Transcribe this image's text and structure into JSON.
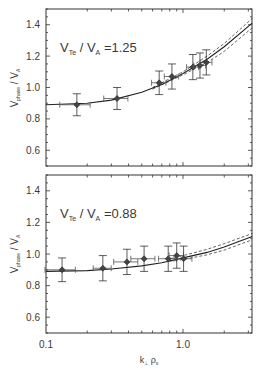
{
  "chart_data": [
    {
      "type": "scatter",
      "panel": "top",
      "annotation": {
        "main": "V",
        "sub1": "Te",
        "mid": " / V",
        "sub2": "A",
        "value": " =1.25"
      },
      "xlabel": "k⊥ ρs",
      "ylabel": "Vphase / VA",
      "xscale": "log",
      "xlim": [
        0.1,
        3.2
      ],
      "ylim": [
        0.5,
        1.5
      ],
      "yticks": [
        0.6,
        0.8,
        1.0,
        1.2,
        1.4
      ],
      "ytick_labels": [
        "0.6",
        "0.8",
        "1.0",
        "1.2",
        "1.4"
      ],
      "series": [
        {
          "name": "measured",
          "marker": "diamond",
          "x": [
            0.168,
            0.33,
            0.67,
            0.83,
            1.18,
            1.33,
            1.48
          ],
          "y": [
            0.89,
            0.93,
            1.03,
            1.07,
            1.13,
            1.14,
            1.16
          ],
          "yerr": [
            0.07,
            0.07,
            0.075,
            0.08,
            0.08,
            0.08,
            0.08
          ],
          "xerr_frac": [
            0.25,
            0.2,
            0.12,
            0.12,
            0.1,
            0.1,
            0.1
          ]
        },
        {
          "name": "theory",
          "style": "solid",
          "x": [
            0.1,
            0.2,
            0.3,
            0.5,
            0.7,
            1.0,
            1.5,
            2.0,
            3.2
          ],
          "y": [
            0.89,
            0.9,
            0.92,
            0.97,
            1.02,
            1.09,
            1.18,
            1.26,
            1.41
          ]
        },
        {
          "name": "theory-upper",
          "style": "dashed",
          "x": [
            0.6,
            1.0,
            1.5,
            2.0,
            3.2
          ],
          "y": [
            1.0,
            1.1,
            1.2,
            1.28,
            1.44
          ]
        },
        {
          "name": "theory-lower",
          "style": "dashed",
          "x": [
            0.6,
            1.0,
            1.5,
            2.0,
            3.2
          ],
          "y": [
            0.99,
            1.08,
            1.16,
            1.23,
            1.38
          ]
        }
      ]
    },
    {
      "type": "scatter",
      "panel": "bottom",
      "annotation": {
        "main": "V",
        "sub1": "Te",
        "mid": " / V",
        "sub2": "A",
        "value": " =0.88"
      },
      "xlabel": "k⊥ ρs",
      "ylabel": "Vphase / VA",
      "xscale": "log",
      "xlim": [
        0.1,
        3.2
      ],
      "ylim": [
        0.5,
        1.5
      ],
      "xticks": [
        0.1,
        1.0
      ],
      "xtick_labels": [
        "0.1",
        "1.0"
      ],
      "yticks": [
        0.6,
        0.8,
        1.0,
        1.2,
        1.4
      ],
      "ytick_labels": [
        "0.6",
        "0.8",
        "1.0",
        "1.2",
        "1.4"
      ],
      "series": [
        {
          "name": "measured",
          "marker": "diamond",
          "x": [
            0.131,
            0.26,
            0.39,
            0.52,
            0.78,
            0.9,
            1.01
          ],
          "y": [
            0.9,
            0.91,
            0.95,
            0.97,
            0.97,
            0.99,
            0.97
          ],
          "yerr": [
            0.075,
            0.08,
            0.08,
            0.08,
            0.08,
            0.08,
            0.08
          ],
          "xerr_frac": [
            0.25,
            0.15,
            0.2,
            0.2,
            0.15,
            0.12,
            0.15
          ]
        },
        {
          "name": "theory",
          "style": "solid",
          "x": [
            0.1,
            0.2,
            0.3,
            0.5,
            0.7,
            1.0,
            1.5,
            2.0,
            3.2
          ],
          "y": [
            0.89,
            0.895,
            0.905,
            0.925,
            0.945,
            0.975,
            1.01,
            1.045,
            1.11
          ]
        },
        {
          "name": "theory-upper",
          "style": "dashed",
          "x": [
            0.8,
            1.0,
            1.5,
            2.0,
            3.2
          ],
          "y": [
            0.97,
            0.99,
            1.03,
            1.065,
            1.13
          ]
        },
        {
          "name": "theory-lower",
          "style": "dashed",
          "x": [
            0.8,
            1.0,
            1.5,
            2.0,
            3.2
          ],
          "y": [
            0.955,
            0.965,
            0.995,
            1.025,
            1.09
          ]
        }
      ]
    }
  ],
  "labels": {
    "top_annotation_main": "V",
    "top_annotation_sub1": "Te",
    "top_annotation_mid": " / V",
    "top_annotation_sub2": "A",
    "top_annotation_value": " =1.25",
    "bottom_annotation_main": "V",
    "bottom_annotation_sub1": "Te",
    "bottom_annotation_mid": " / V",
    "bottom_annotation_sub2": "A",
    "bottom_annotation_value": " =0.88",
    "ylabel_main": "V",
    "ylabel_sub": "phase",
    "ylabel_mid": " / V",
    "ylabel_sub2": "A",
    "xlabel_main": "k",
    "xlabel_sub": "⊥",
    "xlabel_mid": " ρ",
    "xlabel_sub2": "s",
    "xtick_0": "0.1",
    "xtick_1": "1.0"
  }
}
